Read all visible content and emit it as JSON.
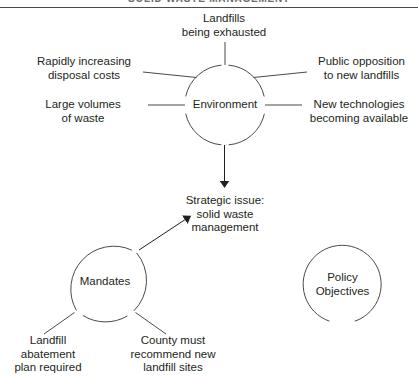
{
  "header": {
    "title": "SOLID WASTE MANAGEMENT"
  },
  "diagram": {
    "nodes": [
      {
        "id": "environment",
        "label": "Environment",
        "cx": 225,
        "cy": 105,
        "r": 40
      },
      {
        "id": "mandates",
        "label": "Mandates",
        "cx": 105,
        "cy": 282,
        "r": 43
      },
      {
        "id": "policy-objectives",
        "label_line1": "Policy",
        "label_line2": "Objectives",
        "cx": 342,
        "cy": 285,
        "r": 39
      }
    ],
    "center": {
      "id": "strategic-issue",
      "line1": "Strategic issue:",
      "line2": "solid waste",
      "line3": "management"
    },
    "environment_factors": [
      {
        "id": "landfills-exhausted",
        "line1": "Landfills",
        "line2": "being exhausted"
      },
      {
        "id": "rapidly-increasing-disposal-costs",
        "line1": "Rapidly increasing",
        "line2": "disposal costs"
      },
      {
        "id": "large-volumes-of-waste",
        "line1": "Large volumes",
        "line2": "of waste"
      },
      {
        "id": "public-opposition",
        "line1": "Public opposition",
        "line2": "to new landfills"
      },
      {
        "id": "new-technologies",
        "line1": "New technologies",
        "line2": "becoming available"
      }
    ],
    "mandate_items": [
      {
        "id": "landfill-abatement-plan",
        "line1": "Landfill",
        "line2": "abatement",
        "line3": "plan required"
      },
      {
        "id": "county-recommend-sites",
        "line1": "County must",
        "line2": "recommend new",
        "line3": "landfill sites"
      }
    ],
    "colors": {
      "ink": "#231f20",
      "stroke": "#4a4a4a",
      "background": "#ffffff"
    }
  }
}
